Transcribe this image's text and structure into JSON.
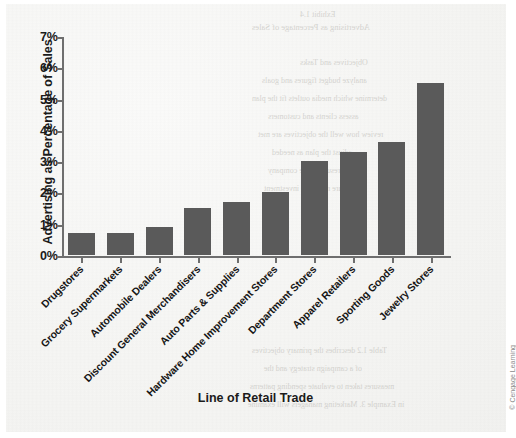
{
  "chart_data": {
    "type": "bar",
    "title": "",
    "xlabel": "Line of Retail Trade",
    "ylabel": "Advertising as Percentage of Sales",
    "categories": [
      "Drugstores",
      "Grocery Supermarkets",
      "Automobile Dealers",
      "Discount General Merchandisers",
      "Auto Parts & Supplies",
      "Hardware Home Improvement Stores",
      "Department Stores",
      "Apparel Retailers",
      "Sporting Goods",
      "Jewelry Stores"
    ],
    "values": [
      0.7,
      0.7,
      0.9,
      1.5,
      1.7,
      2.0,
      3.0,
      3.3,
      3.6,
      5.5
    ],
    "ylim": [
      0,
      7
    ],
    "yticks": [
      0,
      1,
      2,
      3,
      4,
      5,
      6,
      7
    ],
    "ytick_labels": [
      "0%",
      "1%",
      "2%",
      "3%",
      "4%",
      "5%",
      "6%",
      "7%"
    ],
    "grid": false,
    "legend": false,
    "bar_color": "#5a5a5a",
    "axis_color": "#6e6e6e"
  },
  "credit": "© Cengage Learning",
  "ghost_text": [
    {
      "text": "Exhibit 1.4",
      "x": 300,
      "y": 10,
      "size": 8
    },
    {
      "text": "Advertising as Percentage of Sales",
      "x": 252,
      "y": 22,
      "size": 8.5
    },
    {
      "text": "Objectives and Tasks",
      "x": 300,
      "y": 58,
      "size": 8
    },
    {
      "text": "analyze budget figures and goals",
      "x": 262,
      "y": 76,
      "size": 8
    },
    {
      "text": "determine which media outlets fit the plan",
      "x": 252,
      "y": 94,
      "size": 8
    },
    {
      "text": "assess clients and customers",
      "x": 268,
      "y": 112,
      "size": 8
    },
    {
      "text": "review how well the objectives are met",
      "x": 258,
      "y": 130,
      "size": 8
    },
    {
      "text": "adjust the plan as needed",
      "x": 272,
      "y": 148,
      "size": 8
    },
    {
      "text": "deliver results to the company",
      "x": 268,
      "y": 166,
      "size": 8
    },
    {
      "text": "measure return on investment",
      "x": 264,
      "y": 184,
      "size": 8
    },
    {
      "text": "Table 1.2 describes the primary objectives",
      "x": 252,
      "y": 346,
      "size": 8
    },
    {
      "text": "of a campaign strategy and the",
      "x": 264,
      "y": 364,
      "size": 8
    },
    {
      "text": "measures taken to evaluate spending patterns",
      "x": 250,
      "y": 382,
      "size": 8
    },
    {
      "text": "in Example 3. Marketing managers will examine",
      "x": 248,
      "y": 400,
      "size": 8
    }
  ]
}
